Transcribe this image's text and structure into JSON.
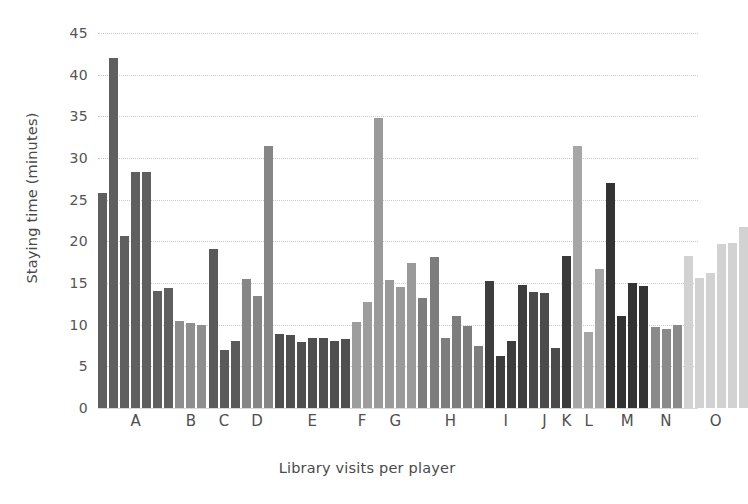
{
  "chart_data": {
    "type": "bar",
    "title": "",
    "subtitle": "",
    "xlabel": "Library visits per player",
    "ylabel": "Staying time (minutes)",
    "ylim": [
      0,
      45
    ],
    "yticks": [
      0,
      5,
      10,
      15,
      20,
      25,
      30,
      35,
      40,
      45
    ],
    "ytick_labels": [
      "0",
      "5",
      "10",
      "15",
      "20",
      "25",
      "30",
      "35",
      "40",
      "45"
    ],
    "grid": true,
    "legend": false,
    "legend_position": "none",
    "categories": [
      "A",
      "B",
      "C",
      "D",
      "E",
      "F",
      "G",
      "H",
      "I",
      "J",
      "K",
      "L",
      "M",
      "N",
      "O"
    ],
    "note": "Grouped bar chart: each labelled player group contains several individual visit bars, shaded by group.",
    "groups": [
      {
        "label": "A",
        "color": "#5f5f5f",
        "values": [
          25.8,
          42.0,
          20.6,
          28.3,
          28.3,
          14.1,
          14.4
        ]
      },
      {
        "label": "B",
        "color": "#8e8e8e",
        "values": [
          10.4,
          10.2,
          10.0
        ]
      },
      {
        "label": "C",
        "color": "#5a5a5a",
        "values": [
          19.1,
          7.0,
          8.0
        ]
      },
      {
        "label": "D",
        "color": "#868686",
        "values": [
          15.5,
          13.5,
          31.5
        ]
      },
      {
        "label": "E",
        "color": "#4f4f4f",
        "values": [
          8.9,
          8.8,
          7.9,
          8.4,
          8.4,
          8.0,
          8.3
        ]
      },
      {
        "label": "F",
        "color": "#9d9d9d",
        "values": [
          10.3,
          12.7
        ]
      },
      {
        "label": "G",
        "color": "#9a9a9a",
        "values": [
          34.8,
          15.4,
          14.5,
          17.4
        ]
      },
      {
        "label": "H",
        "color": "#7d7d7d",
        "values": [
          13.2,
          18.1,
          8.4,
          11.0,
          9.9,
          7.5
        ]
      },
      {
        "label": "I",
        "color": "#3d3d3d",
        "values": [
          15.2,
          6.2,
          8.1,
          14.8
        ]
      },
      {
        "label": "J",
        "color": "#4b4b4b",
        "values": [
          13.9,
          13.8,
          7.2
        ]
      },
      {
        "label": "K",
        "color": "#3a3a3a",
        "values": [
          18.3
        ]
      },
      {
        "label": "L",
        "color": "#a6a6a6",
        "values": [
          31.4,
          9.1,
          16.7
        ]
      },
      {
        "label": "M",
        "color": "#333333",
        "values": [
          27.0,
          11.0,
          15.0,
          14.7
        ]
      },
      {
        "label": "N",
        "color": "#8a8a8a",
        "values": [
          9.7,
          9.5,
          10.0
        ]
      },
      {
        "label": "O",
        "color": "#d2d2d2",
        "values": [
          18.3,
          15.6,
          16.2,
          19.7,
          19.8,
          21.7
        ]
      }
    ],
    "axes": {
      "y_label_text": "Staying time (minutes)",
      "x_label_text": "Library visits per player"
    },
    "style": {
      "background": "#ffffff",
      "gridline_color": "#c9c9c9",
      "text_color": "#4a4a4a"
    }
  }
}
